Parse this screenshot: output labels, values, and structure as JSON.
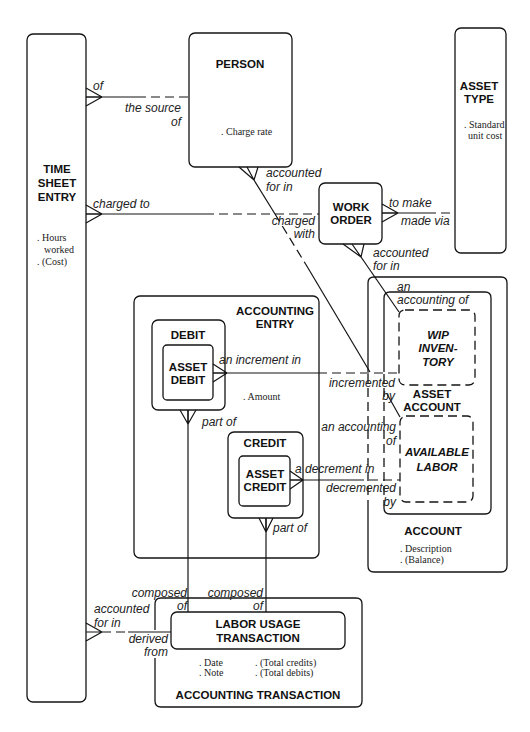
{
  "diagram": {
    "colors": {
      "line": "#141414",
      "background": "#ffffff"
    },
    "entities": {
      "time_sheet_entry": {
        "name": [
          "TIME",
          "SHEET",
          "ENTRY"
        ],
        "attributes": [
          ". Hours",
          "worked",
          ". (Cost)"
        ]
      },
      "person": {
        "name": [
          "PERSON"
        ],
        "attributes": [
          ". Charge rate"
        ]
      },
      "asset_type": {
        "name": [
          "ASSET",
          "TYPE"
        ],
        "attributes": [
          ". Standard",
          "unit cost"
        ]
      },
      "work_order": {
        "name": [
          "WORK",
          "ORDER"
        ]
      },
      "accounting_entry": {
        "name": [
          "ACCOUNTING",
          "ENTRY"
        ],
        "attributes": [
          ". Amount"
        ]
      },
      "debit": {
        "name": [
          "DEBIT"
        ]
      },
      "asset_debit": {
        "name": [
          "ASSET",
          "DEBIT"
        ]
      },
      "credit": {
        "name": [
          "CREDIT"
        ]
      },
      "asset_credit": {
        "name": [
          "ASSET",
          "CREDIT"
        ]
      },
      "account": {
        "name": [
          "ACCOUNT"
        ],
        "attributes": [
          ". Description",
          ". (Balance)"
        ]
      },
      "asset_account": {
        "name": [
          "ASSET",
          "ACCOUNT"
        ]
      },
      "wip_inventory": {
        "name": [
          "WIP",
          "INVEN-",
          "TORY"
        ]
      },
      "available_labor": {
        "name": [
          "AVAILABLE",
          "LABOR"
        ]
      },
      "accounting_transaction": {
        "name": [
          "ACCOUNTING TRANSACTION"
        ],
        "attributes": [
          ". Date",
          ". Note",
          ". (Total credits)",
          ". (Total debits)"
        ]
      },
      "labor_usage_transaction": {
        "name": [
          "LABOR USAGE",
          "TRANSACTION"
        ]
      }
    },
    "relationships": [
      {
        "from": "time_sheet_entry",
        "from_label": [
          "of"
        ],
        "to": "person",
        "to_label": [
          "the source",
          "of"
        ]
      },
      {
        "from": "time_sheet_entry",
        "from_label": [
          "charged to"
        ],
        "to": "work_order",
        "to_label": [
          "charged",
          "with"
        ]
      },
      {
        "from": "work_order",
        "from_label": [
          "to make"
        ],
        "to": "asset_type",
        "to_label": [
          "made via"
        ]
      },
      {
        "from": "person",
        "from_label": [
          "accounted",
          "for in"
        ],
        "to": "available_labor",
        "to_label": [
          "an accounting",
          "of"
        ]
      },
      {
        "from": "work_order",
        "from_label": [
          "accounted",
          "for in"
        ],
        "to": "wip_inventory",
        "to_label": [
          "an",
          "accounting of"
        ]
      },
      {
        "from": "asset_debit",
        "from_label": [
          "an increment in"
        ],
        "to": "wip_inventory",
        "to_label": [
          "incremented",
          "by"
        ]
      },
      {
        "from": "asset_credit",
        "from_label": [
          "a decrement in"
        ],
        "to": "available_labor",
        "to_label": [
          "decremented",
          "by"
        ]
      },
      {
        "from": "debit",
        "from_label": [
          "part of"
        ],
        "to": "labor_usage_transaction",
        "to_label": [
          "composed",
          "of"
        ]
      },
      {
        "from": "credit",
        "from_label": [
          "part of"
        ],
        "to": "labor_usage_transaction",
        "to_label": [
          "composed",
          "of"
        ]
      },
      {
        "from": "time_sheet_entry",
        "from_label": [
          "accounted",
          "for in"
        ],
        "to": "labor_usage_transaction",
        "to_label": [
          "derived",
          "from"
        ]
      }
    ]
  }
}
